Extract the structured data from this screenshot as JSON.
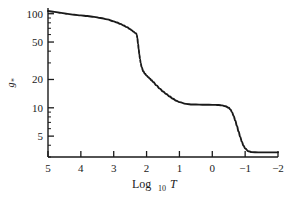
{
  "chart_data": {
    "type": "line",
    "title": "",
    "xlabel": "Log10 T",
    "xlabel_main": "Log",
    "xlabel_sub": "10",
    "xlabel_var": "T",
    "ylabel": "g*",
    "ylabel_main": "g",
    "ylabel_sub": "*",
    "xlim": [
      5,
      -2
    ],
    "ylim": [
      3,
      115
    ],
    "yscale": "log",
    "xscale": "linear",
    "grid": false,
    "legend": null,
    "xticks": [
      5,
      4,
      3,
      2,
      1,
      0,
      -1,
      -2
    ],
    "xtick_labels": [
      "5",
      "4",
      "3",
      "2",
      "1",
      "0",
      "−1",
      "−2"
    ],
    "yticks": [
      100,
      50,
      20,
      10,
      5
    ],
    "ytick_labels": [
      "100",
      "50",
      "20",
      "10",
      "5"
    ],
    "yminor_ticks": [
      90,
      80,
      70,
      60,
      40,
      30,
      9,
      8,
      7,
      6,
      4,
      3
    ],
    "line_color": "#1a1a1a",
    "line_width": 1.9,
    "series": [
      {
        "name": "g*",
        "x": [
          5.0,
          4.8,
          4.6,
          4.4,
          4.2,
          4.0,
          3.8,
          3.6,
          3.4,
          3.2,
          3.0,
          2.9,
          2.8,
          2.7,
          2.6,
          2.5,
          2.45,
          2.4,
          2.35,
          2.32,
          2.3,
          2.28,
          2.26,
          2.24,
          2.22,
          2.2,
          2.18,
          2.15,
          2.1,
          2.05,
          2.0,
          1.95,
          1.9,
          1.85,
          1.8,
          1.7,
          1.6,
          1.5,
          1.4,
          1.3,
          1.2,
          1.1,
          1.0,
          0.8,
          0.6,
          0.4,
          0.2,
          0.0,
          -0.1,
          -0.2,
          -0.3,
          -0.4,
          -0.5,
          -0.55,
          -0.6,
          -0.65,
          -0.7,
          -0.75,
          -0.8,
          -0.85,
          -0.9,
          -0.95,
          -1.0,
          -1.1,
          -1.2,
          -1.4,
          -1.6,
          -1.8,
          -2.0
        ],
        "y": [
          106.7,
          104.5,
          102.0,
          99.5,
          97.5,
          96.0,
          94.5,
          92.5,
          90.0,
          87.0,
          83.0,
          80.5,
          78.0,
          75.0,
          72.0,
          68.5,
          66.5,
          64.5,
          62.5,
          61.8,
          60.0,
          55.0,
          48.0,
          42.0,
          37.0,
          33.0,
          30.0,
          27.0,
          24.5,
          23.0,
          22.0,
          21.2,
          20.4,
          19.6,
          18.8,
          17.3,
          16.0,
          14.9,
          14.0,
          13.2,
          12.5,
          11.9,
          11.5,
          11.0,
          10.85,
          10.8,
          10.78,
          10.75,
          10.74,
          10.7,
          10.6,
          10.4,
          10.0,
          9.6,
          9.0,
          8.2,
          7.3,
          6.4,
          5.6,
          4.9,
          4.35,
          3.95,
          3.7,
          3.45,
          3.38,
          3.36,
          3.36,
          3.36,
          3.36
        ]
      }
    ],
    "annotations": []
  },
  "figure": {
    "background": "#ffffff",
    "axis_color": "#1a1a1a"
  }
}
